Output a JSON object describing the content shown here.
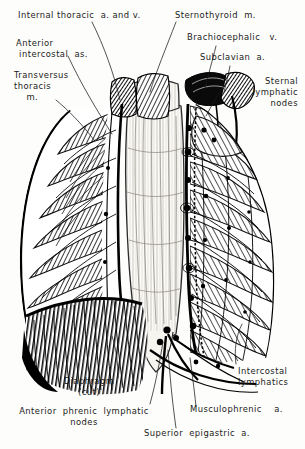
{
  "figure": {
    "style": "pen-and-ink hatched engraving",
    "ink_color": "#111111",
    "paper_color": "#fdfdfb"
  },
  "labels": [
    {
      "id": "internal-thoracic",
      "text": "Internal thoracic  a. and v.",
      "lines": [
        "Internal thoracic  a. and v."
      ]
    },
    {
      "id": "sternothyroid",
      "text": "Sternothyroid  m.",
      "lines": [
        "Sternothyroid  m."
      ]
    },
    {
      "id": "anterior-intercostal",
      "text": "Anterior\n intercostal  as.",
      "lines": [
        "Anterior",
        " intercostal  as."
      ]
    },
    {
      "id": "brachiocephalic",
      "text": "Brachiocephalic   v.",
      "lines": [
        "Brachiocephalic   v."
      ]
    },
    {
      "id": "subclavian",
      "text": "Subclavian  a.",
      "lines": [
        "Subclavian  a."
      ]
    },
    {
      "id": "transversus-thoracis",
      "text": "Transversus\nthoracis\n    m.",
      "lines": [
        "Transversus",
        "thoracis",
        "    m."
      ]
    },
    {
      "id": "sternal-lymphatic",
      "text": "Sternal\nlymphatic\nnodes",
      "lines": [
        "Sternal",
        "lymphatic",
        "nodes"
      ]
    },
    {
      "id": "diaphragm",
      "text": "Diaphragm\n(cut)",
      "lines": [
        "Diaphragm",
        "(cut)"
      ]
    },
    {
      "id": "intercostal-lymphatics",
      "text": "Intercostal\nlymphatics",
      "lines": [
        "Intercostal",
        "lymphatics"
      ]
    },
    {
      "id": "anterior-phrenic",
      "text": "Anterior  phrenic  lymphatic\nnodes",
      "lines": [
        "Anterior  phrenic  lymphatic",
        "nodes"
      ]
    },
    {
      "id": "musculophrenic",
      "text": "Musculophrenic    a.",
      "lines": [
        "Musculophrenic    a."
      ]
    },
    {
      "id": "superior-epigastric",
      "text": "Superior  epigastric  a.",
      "lines": [
        "Superior  epigastric  a."
      ]
    }
  ]
}
